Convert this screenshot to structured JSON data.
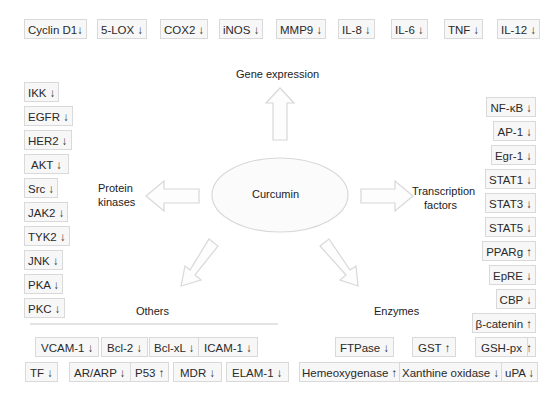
{
  "center": {
    "label": "Curcumin"
  },
  "categories": {
    "gene_expression": "Gene expression",
    "protein_kinases_line1": "Protein",
    "protein_kinases_line2": "kinases",
    "transcription_factors_line1": "Transcription",
    "transcription_factors_line2": "factors",
    "others": "Others",
    "enzymes": "Enzymes"
  },
  "gene_expression": [
    {
      "label": "Cyclin D1↓"
    },
    {
      "label": "5-LOX ↓"
    },
    {
      "label": "COX2 ↓"
    },
    {
      "label": "iNOS ↓"
    },
    {
      "label": "MMP9 ↓"
    },
    {
      "label": "IL-8 ↓"
    },
    {
      "label": "IL-6 ↓"
    },
    {
      "label": "TNF ↓"
    },
    {
      "label": "IL-12 ↓"
    }
  ],
  "protein_kinases": [
    {
      "label": "IKK ↓"
    },
    {
      "label": "EGFR ↓"
    },
    {
      "label": "HER2 ↓"
    },
    {
      "label": "AKT ↓"
    },
    {
      "label": "Src ↓"
    },
    {
      "label": "JAK2 ↓"
    },
    {
      "label": "TYK2 ↓"
    },
    {
      "label": "JNK ↓"
    },
    {
      "label": "PKA ↓"
    },
    {
      "label": "PKC ↓"
    }
  ],
  "transcription_factors": [
    {
      "label": "NF-κB ↓"
    },
    {
      "label": "AP-1 ↓"
    },
    {
      "label": "Egr-1 ↓"
    },
    {
      "label": "STAT1 ↓"
    },
    {
      "label": "STAT3 ↓"
    },
    {
      "label": "STAT5 ↓"
    },
    {
      "label": "PPARg ↑"
    },
    {
      "label": "EpRE ↓"
    },
    {
      "label": "CBP ↓"
    },
    {
      "label": "β-catenin ↑"
    },
    {
      "label": "Nrf2 ↑"
    }
  ],
  "others": {
    "row1": [
      {
        "label": "VCAM-1 ↓"
      },
      {
        "label": "Bcl-2 ↓"
      },
      {
        "label": "Bcl-xL ↓"
      },
      {
        "label": "ICAM-1 ↓"
      }
    ],
    "row2": [
      {
        "label": "TF ↓"
      },
      {
        "label": "AR/ARP ↓"
      },
      {
        "label": "P53 ↑"
      },
      {
        "label": "MDR ↓"
      },
      {
        "label": "ELAM-1 ↓"
      }
    ]
  },
  "enzymes": {
    "row1": [
      {
        "label": "FTPase ↓"
      },
      {
        "label": "GST ↑"
      },
      {
        "label": "GSH-px"
      }
    ],
    "row2": [
      {
        "label": "Hemeoxygenase ↑"
      },
      {
        "label": "Xanthine oxidase ↓"
      },
      {
        "label": "uPA ↓"
      }
    ]
  },
  "colors": {
    "arrow_stroke": "#d8d8d8",
    "box_border": "#d9d9d9",
    "box_fill": "#f7f7f7"
  }
}
